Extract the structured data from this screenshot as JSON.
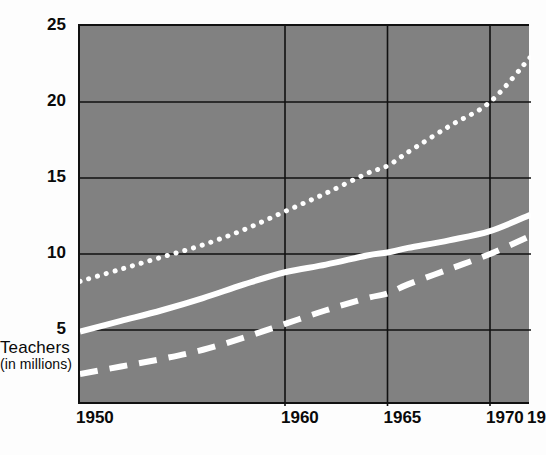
{
  "chart_data": {
    "type": "line",
    "title": "",
    "xlabel": "",
    "ylabel": "Teachers",
    "ylabel_sub": "(in millions)",
    "xlim": [
      1950,
      1972
    ],
    "ylim": [
      0,
      25
    ],
    "grid": true,
    "legend": "none",
    "background_color": "#818181",
    "series_color": "#ffffff",
    "axis_color": "#111111",
    "x_ticks": [
      {
        "label": "1950",
        "value": 1950
      },
      {
        "label": "1960",
        "value": 1960
      },
      {
        "label": "1965",
        "value": 1965
      },
      {
        "label": "1970",
        "value": 1970
      },
      {
        "label": "19",
        "value": 1972
      }
    ],
    "y_ticks": [
      {
        "label": "25",
        "value": 25
      },
      {
        "label": "20",
        "value": 20
      },
      {
        "label": "15",
        "value": 15
      },
      {
        "label": "10",
        "value": 10
      },
      {
        "label": "5",
        "value": 5
      }
    ],
    "x": [
      1950,
      1952,
      1954,
      1956,
      1958,
      1960,
      1962,
      1964,
      1965,
      1966,
      1968,
      1970,
      1972
    ],
    "series": [
      {
        "name": "dotted-series",
        "style": "dotted",
        "values": [
          8.2,
          9.0,
          9.8,
          10.6,
          11.6,
          12.8,
          14.0,
          15.3,
          15.8,
          16.7,
          18.4,
          20.0,
          23.0
        ]
      },
      {
        "name": "solid-series",
        "style": "solid",
        "values": [
          4.9,
          5.6,
          6.3,
          7.1,
          8.0,
          8.8,
          9.3,
          9.9,
          10.1,
          10.4,
          10.9,
          11.5,
          12.6
        ]
      },
      {
        "name": "dashed-series",
        "style": "dashed",
        "values": [
          2.1,
          2.6,
          3.1,
          3.7,
          4.5,
          5.4,
          6.3,
          7.1,
          7.4,
          8.0,
          9.0,
          10.0,
          11.2
        ]
      }
    ]
  }
}
